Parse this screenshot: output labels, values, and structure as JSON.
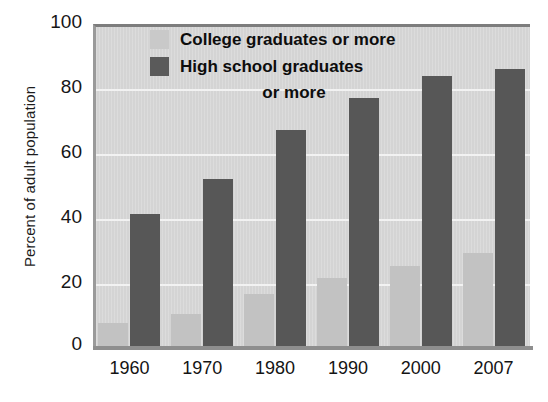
{
  "chart_data": {
    "type": "bar",
    "title": "",
    "subtitle": "",
    "xlabel": "",
    "ylabel": "Percent of adult population",
    "categories": [
      "1960",
      "1970",
      "1980",
      "1990",
      "2000",
      "2007"
    ],
    "series": [
      {
        "name": "College graduates or more",
        "color": "#c2c2c2",
        "values": [
          7,
          10,
          16,
          21,
          25,
          29
        ]
      },
      {
        "name": "High school graduates or more",
        "color": "#575757",
        "values": [
          41,
          52,
          67,
          77,
          84,
          86
        ]
      }
    ],
    "ylim": [
      0,
      100
    ],
    "yticks": [
      "0",
      "20",
      "40",
      "60",
      "80",
      "100"
    ],
    "ytick_values": [
      0,
      20,
      40,
      60,
      80,
      100
    ],
    "grid": "horizontal",
    "legend_position": "top-center",
    "plot_background": "#d4d4d4",
    "gridline_color": "#f2f2f2"
  },
  "legend": {
    "entries": [
      {
        "label": "College graduates or more",
        "swatch": "#c9c9c9"
      },
      {
        "label": "High school graduates",
        "swatch": "#5a5a5a",
        "continuation": "or more"
      }
    ]
  },
  "axes": {
    "y_title": "Percent of adult population"
  }
}
